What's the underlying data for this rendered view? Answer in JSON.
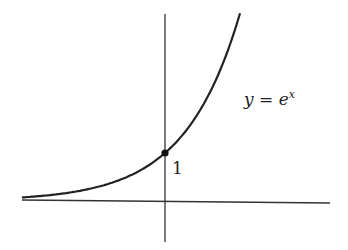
{
  "chart_data": {
    "type": "line",
    "title": "",
    "xlabel": "",
    "ylabel": "",
    "grid": false,
    "legend": "none",
    "series": [
      {
        "name": "y = e^x",
        "function": "exp(x)",
        "x": [
          -3,
          -2.5,
          -2,
          -1.5,
          -1,
          -0.5,
          0,
          0.5,
          1,
          1.5,
          2
        ],
        "values": [
          0.05,
          0.08,
          0.14,
          0.22,
          0.37,
          0.61,
          1.0,
          1.65,
          2.72,
          4.48,
          7.39
        ]
      }
    ],
    "annotations": [
      {
        "text_prefix": "y = e",
        "superscript": "x",
        "position": "right of curve"
      },
      {
        "text": "1",
        "point": [
          0,
          1
        ],
        "marker": "filled dot at y-intercept"
      }
    ],
    "axes": {
      "x_axis": true,
      "y_axis": true,
      "ticks": "none"
    }
  },
  "labels": {
    "curve_prefix": "y = e",
    "curve_sup": "x",
    "intercept": "1"
  }
}
